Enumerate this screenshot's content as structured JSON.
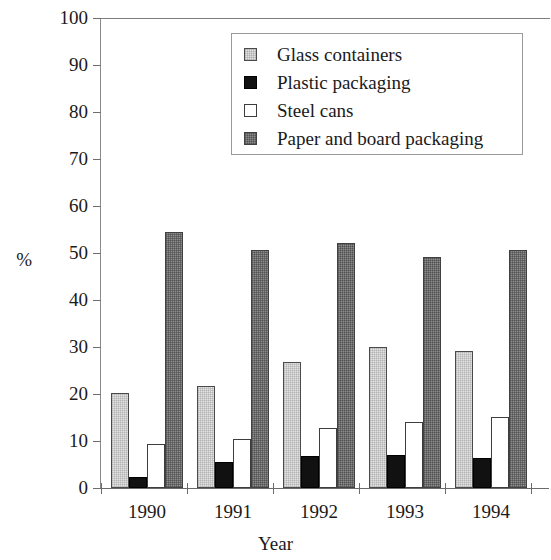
{
  "chart_data": {
    "type": "bar",
    "title": "",
    "xlabel": "Year",
    "ylabel": "%",
    "categories": [
      "1990",
      "1991",
      "1992",
      "1993",
      "1994"
    ],
    "series": [
      {
        "name": "Glass containers",
        "color": "#e3e3e3",
        "values": [
          20.3,
          21.6,
          26.9,
          30.0,
          29.2
        ]
      },
      {
        "name": "Plastic packaging",
        "color": "#111111",
        "values": [
          2.3,
          5.6,
          6.9,
          7.1,
          6.3
        ]
      },
      {
        "name": "Steel cans",
        "color": "#ffffff",
        "values": [
          9.4,
          10.5,
          12.7,
          14.1,
          15.1
        ]
      },
      {
        "name": "Paper and board packaging",
        "color": "#8d8d8d",
        "values": [
          54.5,
          50.7,
          52.2,
          49.2,
          50.7
        ]
      }
    ],
    "ylim": [
      0,
      100
    ],
    "yticks": [
      0,
      10,
      20,
      30,
      40,
      50,
      60,
      70,
      80,
      90,
      100
    ],
    "ytick_labels": [
      "0",
      "10",
      "20",
      "30",
      "40",
      "50",
      "60",
      "70",
      "80",
      "90",
      "100"
    ],
    "grid": false,
    "legend_position": "top-center"
  },
  "legend": {
    "items": [
      {
        "label": "Glass containers"
      },
      {
        "label": "Plastic packaging"
      },
      {
        "label": "Steel cans"
      },
      {
        "label": "Paper and board packaging"
      }
    ]
  },
  "axes": {
    "y_unit_label": "%",
    "x_title": "Year"
  }
}
